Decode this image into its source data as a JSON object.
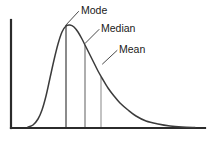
{
  "figure": {
    "name": "skewed-distribution-mode-median-mean",
    "background_color": "#ffffff"
  },
  "colors": {
    "axis": "#2b2b2b",
    "curve": "#3b3b3b",
    "leader": "#4a4a4a",
    "label_text": "#1a1a1a",
    "marker_mode": "#6e6e6e",
    "marker_median": "#9a9a9a",
    "marker_mean": "#b4b4b4"
  },
  "axes": {
    "y_axis": {
      "x": 11,
      "y_top": 20,
      "y_bottom": 128,
      "width": 2.2
    },
    "x_axis": {
      "y": 128,
      "x_left": 11,
      "x_right": 205,
      "width": 2.2
    }
  },
  "chart_data": {
    "type": "line",
    "title": "",
    "subtitle": "",
    "xlabel": "",
    "ylabel": "",
    "grid": false,
    "legend": "none",
    "distribution": "right-skewed",
    "skew_direction": "positive",
    "xlim": [
      11,
      205
    ],
    "ylim": [
      128,
      20
    ],
    "curve_points": [
      [
        28,
        127
      ],
      [
        33,
        125
      ],
      [
        38,
        119
      ],
      [
        42,
        110
      ],
      [
        46,
        96
      ],
      [
        50,
        78
      ],
      [
        54,
        60
      ],
      [
        58,
        44
      ],
      [
        62,
        32
      ],
      [
        66,
        26
      ],
      [
        70,
        25
      ],
      [
        74,
        27
      ],
      [
        78,
        32
      ],
      [
        82,
        39
      ],
      [
        86,
        47
      ],
      [
        90,
        55
      ],
      [
        94,
        63
      ],
      [
        98,
        71
      ],
      [
        102,
        78
      ],
      [
        108,
        88
      ],
      [
        114,
        96
      ],
      [
        120,
        103
      ],
      [
        128,
        110
      ],
      [
        136,
        116
      ],
      [
        146,
        121
      ],
      [
        158,
        124
      ],
      [
        170,
        126
      ],
      [
        182,
        127
      ],
      [
        195,
        127.5
      ]
    ],
    "markers": [
      {
        "key": "mode",
        "label": "Mode",
        "x": 66,
        "y_top": 26,
        "y_bottom": 127,
        "width": 1.6,
        "color": "#6e6e6e"
      },
      {
        "key": "median",
        "label": "Median",
        "x": 85,
        "y_top": 45,
        "y_bottom": 127,
        "width": 1.6,
        "color": "#9a9a9a"
      },
      {
        "key": "mean",
        "label": "Mean",
        "x": 101,
        "y_top": 77,
        "y_bottom": 127,
        "width": 1.6,
        "color": "#b4b4b4"
      }
    ],
    "annotations": [
      {
        "key": "mode",
        "text": "Mode",
        "label_x": 81,
        "label_y": 14,
        "leader": "M 78.5,11.5 L 65.5,25.5"
      },
      {
        "key": "median",
        "text": "Median",
        "label_x": 101,
        "label_y": 32,
        "leader": "M 99,29.5 L 85,43.5"
      },
      {
        "key": "mean",
        "text": "Mean",
        "label_x": 119,
        "label_y": 53,
        "leader": "M 117,50.5 L 102.5,64"
      }
    ]
  }
}
